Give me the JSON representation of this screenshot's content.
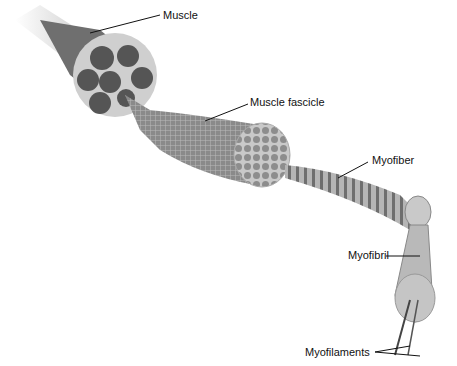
{
  "diagram": {
    "labels": {
      "muscle": "Muscle",
      "fascicle": "Muscle fascicle",
      "myofiber": "Myofiber",
      "myofibril": "Myofibril",
      "myofilaments": "Myofilaments"
    },
    "colors": {
      "muscle_fill": "#6a6a6a",
      "fascicle_fill": "#8c8c8c",
      "tendon": "#d8d8d8",
      "leader_line": "#111111"
    }
  }
}
